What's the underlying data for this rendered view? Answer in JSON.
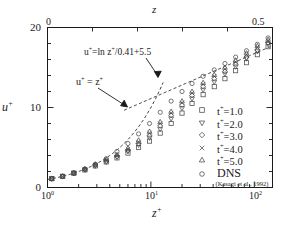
{
  "chart_data": {
    "type": "scatter",
    "title": "",
    "xlabel": "z+",
    "ylabel": "u+",
    "xscale": "log",
    "yscale": "linear",
    "xlim": [
      1,
      150
    ],
    "ylim": [
      0,
      20
    ],
    "yticks": [
      "0",
      "10",
      "20"
    ],
    "xticks": [
      "10^0",
      "10^1",
      "10^2"
    ],
    "top_axis": {
      "label": "z",
      "min": "0",
      "max": "0.5",
      "scale": "linear"
    },
    "grid": false,
    "legend_position": "right-lower",
    "annotations": [
      {
        "text": "u+=ln z+/0.41+5.5",
        "kind": "log-law-curve-label"
      },
      {
        "text": "u+ = z+",
        "kind": "linear-sublayer-curve-label"
      }
    ],
    "reference_curves": [
      {
        "name": "u+ = z+",
        "style": "dashed",
        "expression": "u = z"
      },
      {
        "name": "u+=ln z+/0.41+5.5",
        "style": "dashed",
        "expression": "u = ln(z)/0.41 + 5.5"
      }
    ],
    "series": [
      {
        "name": "t+=1.0",
        "marker": "square",
        "x": [
          1.1,
          1.4,
          1.8,
          2.3,
          2.9,
          3.7,
          4.7,
          6.0,
          7.6,
          9.7,
          12.3,
          15.7,
          20,
          25,
          32,
          41,
          52,
          66,
          84,
          107,
          136
        ],
        "y": [
          1.1,
          1.4,
          1.8,
          2.2,
          2.7,
          3.2,
          3.7,
          4.3,
          5.0,
          5.8,
          6.8,
          8.0,
          9.3,
          10.5,
          11.6,
          12.6,
          13.6,
          14.6,
          15.6,
          16.6,
          17.6
        ]
      },
      {
        "name": "t+=2.0",
        "marker": "triangle-down",
        "x": [
          1.1,
          1.4,
          1.8,
          2.3,
          2.9,
          3.7,
          4.7,
          6.0,
          7.6,
          9.7,
          12.3,
          15.7,
          20,
          25,
          32,
          41,
          52,
          66,
          84,
          107,
          136
        ],
        "y": [
          1.1,
          1.4,
          1.8,
          2.2,
          2.7,
          3.2,
          3.8,
          4.5,
          5.3,
          6.2,
          7.3,
          8.6,
          9.9,
          11.1,
          12.2,
          13.2,
          14.2,
          15.1,
          16.1,
          17.0,
          17.9
        ]
      },
      {
        "name": "t+=3.0",
        "marker": "diamond",
        "x": [
          1.1,
          1.4,
          1.8,
          2.3,
          2.9,
          3.7,
          4.7,
          6.0,
          7.6,
          9.7,
          12.3,
          15.7,
          20,
          25,
          32,
          41,
          52,
          66,
          84,
          107,
          136
        ],
        "y": [
          1.1,
          1.4,
          1.8,
          2.3,
          2.8,
          3.3,
          3.9,
          4.6,
          5.5,
          6.5,
          7.7,
          9.0,
          10.3,
          11.5,
          12.6,
          13.6,
          14.5,
          15.4,
          16.3,
          17.2,
          18.1
        ]
      },
      {
        "name": "t+=4.0",
        "marker": "cross",
        "x": [
          1.1,
          1.4,
          1.8,
          2.3,
          2.9,
          3.7,
          4.7,
          6.0,
          7.6,
          9.7,
          12.3,
          15.7,
          20,
          25,
          32,
          41,
          52,
          66,
          84,
          107,
          136
        ],
        "y": [
          1.1,
          1.4,
          1.8,
          2.3,
          2.8,
          3.4,
          4.0,
          4.8,
          5.7,
          6.8,
          8.0,
          9.3,
          10.6,
          11.8,
          12.9,
          13.9,
          14.8,
          15.7,
          16.6,
          17.5,
          18.3
        ]
      },
      {
        "name": "t+=5.0",
        "marker": "triangle-up",
        "x": [
          1.1,
          1.4,
          1.8,
          2.3,
          2.9,
          3.7,
          4.7,
          6.0,
          7.6,
          9.7,
          12.3,
          15.7,
          20,
          25,
          32,
          41,
          52,
          66,
          84,
          107,
          136
        ],
        "y": [
          1.1,
          1.4,
          1.8,
          2.3,
          2.9,
          3.5,
          4.1,
          4.9,
          5.9,
          7.0,
          8.2,
          9.5,
          10.8,
          12.0,
          13.1,
          14.1,
          15.0,
          15.9,
          16.8,
          17.7,
          18.5
        ]
      },
      {
        "name": "DNS",
        "marker": "circle",
        "x": [
          1.1,
          1.4,
          1.8,
          2.3,
          2.9,
          3.7,
          4.7,
          6.0,
          7.6,
          9.7,
          12.3,
          15.7,
          20,
          25,
          32,
          41,
          52,
          66,
          84,
          107,
          136
        ],
        "y": [
          1.1,
          1.4,
          1.8,
          2.3,
          2.9,
          3.6,
          4.5,
          5.5,
          6.7,
          8.0,
          9.4,
          10.8,
          12.0,
          13.0,
          13.9,
          14.7,
          15.5,
          16.3,
          17.1,
          17.9,
          18.7
        ]
      }
    ]
  },
  "axes": {
    "top_title": "z",
    "top_min": "0",
    "top_max": "0.5",
    "y_title_base": "u",
    "y_title_sup": "+",
    "y_ticks": {
      "t0": "0",
      "t10": "10",
      "t20": "20"
    },
    "x_title_base": "z",
    "x_title_sup": "+",
    "x_ticks": {
      "t1_base": "10",
      "t1_exp": "0",
      "t2_base": "10",
      "t2_exp": "1",
      "t3_base": "10",
      "t3_exp": "2"
    }
  },
  "annotations": {
    "log_law": {
      "u": "u",
      "sup1": "+",
      "eq": "=ln z",
      "sup2": "+",
      "rest": "/0.41+5.5"
    },
    "linear": {
      "u": "u",
      "sup1": "+",
      "eq": " = z",
      "sup2": "+"
    }
  },
  "legend": {
    "items": [
      {
        "label_base": "t",
        "label_sup": "+",
        "label_rest": "=1.0",
        "marker": "square-marker"
      },
      {
        "label_base": "t",
        "label_sup": "+",
        "label_rest": "=2.0",
        "marker": "triangle-down-marker"
      },
      {
        "label_base": "t",
        "label_sup": "+",
        "label_rest": "=3.0",
        "marker": "diamond-marker"
      },
      {
        "label_base": "t",
        "label_sup": "+",
        "label_rest": "=4.0",
        "marker": "cross-marker"
      },
      {
        "label_base": "t",
        "label_sup": "+",
        "label_rest": "=5.0",
        "marker": "triangle-up-marker"
      }
    ],
    "dns_label": "DNS",
    "dns_marker": "circle-marker",
    "citation": "(Kasagi et al., 1992)"
  },
  "colors": {
    "ink": "#1a1a1a",
    "background": "#ffffff",
    "marker": "#555555"
  }
}
